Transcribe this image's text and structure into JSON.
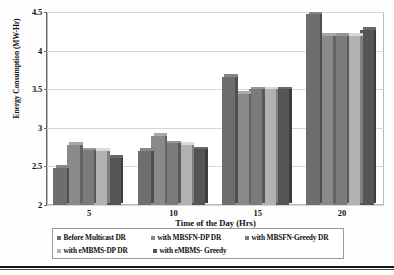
{
  "chart_data": {
    "type": "bar",
    "title": "",
    "xlabel": "Time of the Day (Hrs)",
    "ylabel": "Energy Consumption (MW-Hr)",
    "categories": [
      "5",
      "10",
      "15",
      "20"
    ],
    "ylim": [
      2,
      4.5
    ],
    "yticks": [
      "2",
      "2.5",
      "3",
      "3.5",
      "4",
      "4.5"
    ],
    "grid": true,
    "legend_position": "bottom",
    "series": [
      {
        "name": "Before Multicast DR",
        "color": "#6e6e6e",
        "values": [
          2.48,
          2.7,
          3.66,
          4.47
        ]
      },
      {
        "name": "with MBSFN-DP DR",
        "color": "#8a8a8a",
        "values": [
          2.78,
          2.9,
          3.44,
          4.19
        ]
      },
      {
        "name": "with MBSFN-Greedy DR",
        "color": "#7b7b7b",
        "values": [
          2.71,
          2.8,
          3.5,
          4.19
        ]
      },
      {
        "name": "with eMBMS-DP DR",
        "color": "#b2b2b2",
        "values": [
          2.7,
          2.78,
          3.5,
          4.19
        ]
      },
      {
        "name": "with eMBMS- Greedy",
        "color": "#555555",
        "values": [
          2.61,
          2.72,
          3.5,
          4.27
        ]
      }
    ]
  },
  "axes": {
    "y_title": "Energy Consumption (MW-Hr)",
    "x_title": "Time of the Day (Hrs)",
    "y_ticks": [
      "4.5",
      "4",
      "3.5",
      "3",
      "2.5",
      "2"
    ],
    "x_ticks": [
      "5",
      "10",
      "15",
      "20"
    ]
  },
  "legend": {
    "row1": [
      {
        "label": "Before Multicast DR"
      },
      {
        "label": "with MBSFN-DP DR"
      },
      {
        "label": "with MBSFN-Greedy DR"
      }
    ],
    "row2": [
      {
        "label": "with eMBMS-DP DR"
      },
      {
        "label": "with eMBMS- Greedy"
      }
    ]
  }
}
